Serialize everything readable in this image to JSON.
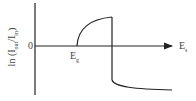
{
  "diagram": {
    "y_axis_label": {
      "prefix": "ln (I",
      "sub1": "out",
      "middle": "/I",
      "sub2": "in",
      "suffix": ")"
    },
    "zero_label": "0",
    "x_axis_label": {
      "main": "E",
      "sub": "s"
    },
    "gap_marker": {
      "main": "E",
      "sub": "g"
    },
    "colors": {
      "line": "#222222",
      "text": "#444444",
      "background": "#ffffff"
    }
  }
}
